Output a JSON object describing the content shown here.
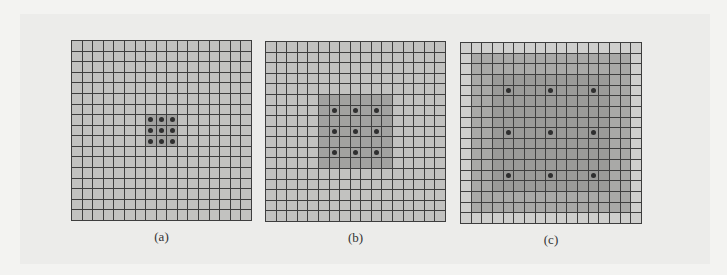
{
  "figure": {
    "grid_size": 17,
    "panels": [
      {
        "id": "a",
        "caption": "(a)",
        "left": 71,
        "top": 40,
        "size": 181,
        "dilation": 1,
        "receptive_field": 3,
        "dots": [
          7,
          8,
          9
        ],
        "rf_range": [
          7,
          9
        ]
      },
      {
        "id": "b",
        "caption": "(b)",
        "left": 265,
        "top": 41,
        "size": 181,
        "dilation": 2,
        "receptive_field": 7,
        "dots": [
          6,
          8,
          10
        ],
        "rf_range": [
          5,
          11
        ]
      },
      {
        "id": "c",
        "caption": "(c)",
        "left": 460,
        "top": 42,
        "size": 182,
        "dilation": 4,
        "receptive_field": 15,
        "dots": [
          4,
          8,
          12
        ],
        "rf_range": [
          1,
          15
        ]
      }
    ],
    "colors": {
      "background": "#f3f3f1",
      "grid_line": "#3e3e3e",
      "cell": "#c2c2c0",
      "receptive_field": "#a2a2a0",
      "dot": "#2f2f2f"
    }
  }
}
